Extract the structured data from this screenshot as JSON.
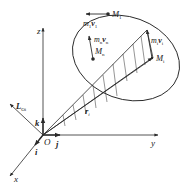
{
  "diagram": {
    "type": "vector-diagram",
    "colors": {
      "line": "#2a2a2a",
      "background": "#ffffff"
    },
    "axes": {
      "x": "x",
      "y": "y",
      "z": "z",
      "origin": "O",
      "unit_i": "i",
      "unit_j": "j",
      "unit_k": "k"
    },
    "vectors": {
      "angular_momentum": {
        "base": "L",
        "sub": "Oi"
      },
      "position": {
        "base": "r",
        "sub": "i"
      }
    },
    "particles": [
      {
        "name": {
          "base": "M",
          "sub": "1"
        },
        "momentum": {
          "m": "m",
          "msub": "1",
          "v": "v",
          "vsub": "1"
        }
      },
      {
        "name": {
          "base": "M",
          "sub": "n"
        },
        "momentum": {
          "m": "m",
          "msub": "n",
          "v": "v",
          "vsub": "n"
        }
      },
      {
        "name": {
          "base": "M",
          "sub": "i"
        },
        "momentum": {
          "m": "m",
          "msub": "i",
          "v": "v",
          "vsub": "i"
        }
      }
    ]
  }
}
